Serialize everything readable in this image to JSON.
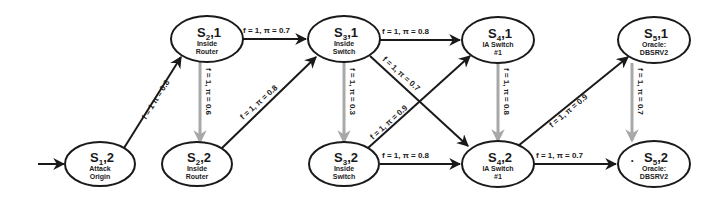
{
  "diagram": {
    "colors": {
      "node_stroke": "#1a1a1a",
      "edge_dark": "#1a1a1a",
      "edge_grey": "#a8a8a8",
      "background": "#ffffff"
    },
    "nodes": [
      {
        "id": "s1_2",
        "state": "S",
        "sub": "1",
        "index": "2",
        "line1": "Attack",
        "line2": "Origin",
        "start": true
      },
      {
        "id": "s2_1",
        "state": "S",
        "sub": "2",
        "index": "1",
        "line1": "Inside",
        "line2": "Router"
      },
      {
        "id": "s2_2",
        "state": "S",
        "sub": "2",
        "index": "2",
        "line1": "Inside",
        "line2": "Router"
      },
      {
        "id": "s3_1",
        "state": "S",
        "sub": "3",
        "index": "1",
        "line1": "Inside",
        "line2": "Switch"
      },
      {
        "id": "s3_2",
        "state": "S",
        "sub": "3",
        "index": "2",
        "line1": "Inside",
        "line2": "Switch"
      },
      {
        "id": "s4_1",
        "state": "S",
        "sub": "4",
        "index": "1",
        "line1": "IA Switch",
        "line2": "#1"
      },
      {
        "id": "s4_2",
        "state": "S",
        "sub": "4",
        "index": "2",
        "line1": "IA Switch",
        "line2": "#1"
      },
      {
        "id": "s5_1",
        "state": "S",
        "sub": "5",
        "index": "1",
        "line1": "Oracle:",
        "line2": "DBSRV2"
      },
      {
        "id": "s5_2",
        "state": "S",
        "sub": "5",
        "index": "2",
        "line1": "Oracle:",
        "line2": "DBSRV2",
        "marker": "•"
      }
    ],
    "edges": [
      {
        "from": "s1_2",
        "to": "s2_1",
        "label": "f = 1  π = 0.8",
        "style": "dark"
      },
      {
        "from": "s2_1",
        "to": "s3_1",
        "label": "f = 1,  π = 0.7",
        "style": "dark"
      },
      {
        "from": "s2_1",
        "to": "s2_2",
        "label": "f = 1,  π = 0.6",
        "style": "grey"
      },
      {
        "from": "s2_2",
        "to": "s3_1",
        "label": "f = 1,  π = 0.8",
        "style": "dark"
      },
      {
        "from": "s3_1",
        "to": "s4_1",
        "label": "f = 1,  π = 0.8",
        "style": "dark"
      },
      {
        "from": "s3_1",
        "to": "s3_2",
        "label": "f = 1,  π = 0.3",
        "style": "grey"
      },
      {
        "from": "s3_1",
        "to": "s4_2",
        "label": "f = 1,  π = 0.7",
        "style": "dark"
      },
      {
        "from": "s3_2",
        "to": "s4_1",
        "label": "f = 1,  π = 0.9",
        "style": "dark"
      },
      {
        "from": "s3_2",
        "to": "s4_2",
        "label": "f = 1,  π = 0.8",
        "style": "dark"
      },
      {
        "from": "s4_1",
        "to": "s4_2",
        "label": "f = 1,  π = 0.8",
        "style": "grey"
      },
      {
        "from": "s4_2",
        "to": "s5_1",
        "label": "f = 1,  π = 0.9",
        "style": "dark"
      },
      {
        "from": "s4_2",
        "to": "s5_2",
        "label": "f = 1,  π = 0.7",
        "style": "dark"
      },
      {
        "from": "s5_1",
        "to": "s5_2",
        "label": "f = 1,  π = 0.7",
        "style": "grey"
      }
    ]
  }
}
